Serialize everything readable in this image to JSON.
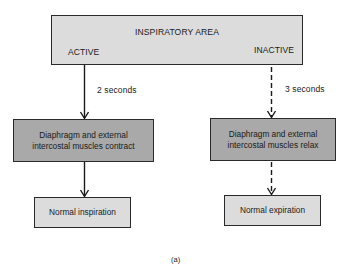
{
  "diagram": {
    "top_box": {
      "title": "INSPIRATORY AREA",
      "left_label": "ACTIVE",
      "right_label": "INACTIVE"
    },
    "left_branch": {
      "duration": "2 seconds",
      "arrow_style": "solid",
      "middle_box": {
        "line1": "Diaphragm and external",
        "line2": "intercostal muscles contract"
      },
      "bottom_box": "Normal inspiration"
    },
    "right_branch": {
      "duration": "3 seconds",
      "arrow_style": "dashed",
      "middle_box": {
        "line1": "Diaphragm and external",
        "line2": "intercostal muscles relax"
      },
      "bottom_box": "Normal expiration"
    },
    "caption": "(a)",
    "colors": {
      "light_box": "#dcdcdc",
      "dark_box": "#a9a9a9",
      "line": "#1a1a1a"
    }
  }
}
